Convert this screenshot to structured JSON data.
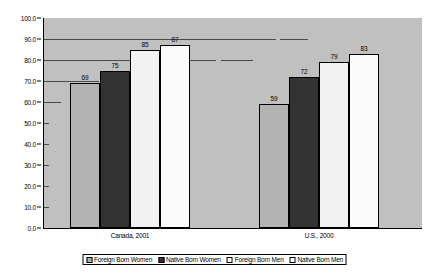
{
  "chart_data": {
    "type": "bar",
    "title": "",
    "subtitle": "",
    "xlabel": "",
    "ylabel": "",
    "ylim": [
      0,
      100
    ],
    "ytick_step": 10,
    "ytick_labels": [
      "0.0",
      "10.0",
      "20.0",
      "30.0",
      "40.0",
      "50.0",
      "60.0",
      "70.0",
      "80.0",
      "90.0",
      "100.0"
    ],
    "grid": "horizontal-partial",
    "legend_position": "bottom",
    "categories": [
      "Canada, 2001",
      "U.S., 2000"
    ],
    "series": [
      {
        "name": "Foreign Born Women",
        "color": "#b3b3b3",
        "values": [
          69,
          59
        ]
      },
      {
        "name": "Native Born Women",
        "color": "#333333",
        "values": [
          75,
          72
        ]
      },
      {
        "name": "Foreign Born Men",
        "color": "#f2f2f2",
        "values": [
          85,
          79
        ]
      },
      {
        "name": "Native Born Men",
        "color": "#fbfbfb",
        "values": [
          87,
          83
        ]
      }
    ],
    "data_labels": [
      [
        "69",
        "75",
        "85",
        "87"
      ],
      [
        "59",
        "72",
        "79",
        "83"
      ]
    ],
    "plot_background": "#c0c0c0",
    "axis_color": "#000000"
  }
}
